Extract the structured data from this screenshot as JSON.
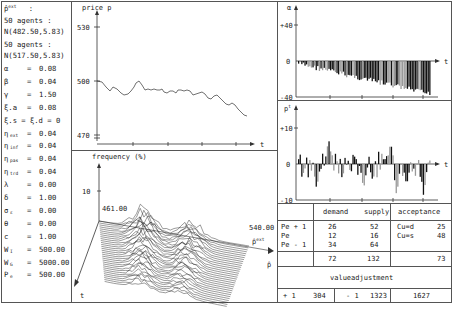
{
  "parameters": {
    "header_symbol": "p̂",
    "header_sup": "ext",
    "header_colon": ":",
    "group1": {
      "label": "50  agents  :",
      "dist": "N(482.50,5.83)"
    },
    "group2": {
      "label": "50  agents  :",
      "dist": "N(517.50,5.83)"
    },
    "rows": [
      {
        "sym": "α",
        "sub": "",
        "eq": "=",
        "val": "0.08"
      },
      {
        "sym": "β",
        "sub": "",
        "eq": "=",
        "val": "0.04"
      },
      {
        "sym": "γ",
        "sub": "",
        "eq": "=",
        "val": "1.50"
      },
      {
        "sym": "ξ.a",
        "sub": "",
        "eq": "=",
        "val": "0.08"
      },
      {
        "sym": "ξ.s = ξ.d = 0",
        "sub": "",
        "eq": "",
        "val": ""
      },
      {
        "sym": "η",
        "sub": "ext",
        "eq": "=",
        "val": "0.04"
      },
      {
        "sym": "η",
        "sub": "inf",
        "eq": "=",
        "val": "0.04"
      },
      {
        "sym": "η",
        "sub": "pas",
        "eq": "=",
        "val": "0.04"
      },
      {
        "sym": "η",
        "sub": "trd",
        "eq": "=",
        "val": "0.04"
      },
      {
        "sym": "λ",
        "sub": "",
        "eq": "=",
        "val": "0.00"
      },
      {
        "sym": "δ",
        "sub": "",
        "eq": "=",
        "val": "1.00"
      },
      {
        "sym": "σ",
        "sub": "ε",
        "eq": "=",
        "val": "0.00"
      },
      {
        "sym": "θ",
        "sub": "",
        "eq": "=",
        "val": "0.00"
      },
      {
        "sym": "c",
        "sub": "",
        "eq": "=",
        "val": "1.00"
      },
      {
        "sym": "W",
        "sub": "I",
        "eq": "=",
        "val": "500.00"
      },
      {
        "sym": "W",
        "sub": "G",
        "eq": "=",
        "val": "5000.00"
      },
      {
        "sym": "P",
        "sub": "e",
        "eq": "=",
        "val": "500.00"
      }
    ]
  },
  "price_plot": {
    "ylabel": "price p",
    "xlabel": "t",
    "ticks": [
      "530",
      "500",
      "470"
    ]
  },
  "freq_plot": {
    "zlabel": "frequency (%)",
    "ztick": "10",
    "left_value": "461.00",
    "right_value": "540.00",
    "axis_pext": "p̂",
    "axis_pext_sup": "ext",
    "axis_p": "p̂",
    "axis_t": "t"
  },
  "alpha_plot": {
    "ylabel": "α",
    "xlabel": "t",
    "ticks": [
      "+40",
      "0",
      "-40"
    ]
  },
  "pt_plot": {
    "ylabel": "p",
    "ylabel_sup": "t",
    "xlabel": "t",
    "ticks": [
      "+10",
      "0",
      "-10"
    ]
  },
  "table": {
    "headers": [
      "",
      "demand",
      "supply",
      "acceptance"
    ],
    "rows": [
      {
        "label": "Pe + 1",
        "demand": "26",
        "supply": "52",
        "acc_label": "Cu=d",
        "acc_val": "25"
      },
      {
        "label": "Pe",
        "demand": "12",
        "supply": "16",
        "acc_label": "Cu=s",
        "acc_val": "48"
      },
      {
        "label": "Pe - 1",
        "demand": "34",
        "supply": "64",
        "acc_label": "",
        "acc_val": ""
      }
    ],
    "totals": {
      "demand": "72",
      "supply": "132",
      "acceptance": "73"
    },
    "value_title": "valueadjustment",
    "value_row": {
      "plus_label": "+ 1",
      "plus_val": "304",
      "minus_label": "- 1",
      "minus_val": "1323",
      "total": "1627"
    }
  },
  "chart_data": [
    {
      "type": "line",
      "title": "",
      "xlabel": "t",
      "ylabel": "price p",
      "yticks": [
        470,
        500,
        530
      ],
      "ylim": [
        470,
        530
      ],
      "x": [
        0,
        1,
        2,
        3,
        4,
        5,
        6,
        7,
        8,
        9,
        10,
        11,
        12,
        13,
        14,
        15,
        16,
        17,
        18,
        19,
        20
      ],
      "values": [
        500,
        499,
        496,
        497,
        494,
        495,
        500,
        496,
        496,
        495,
        494,
        494,
        492,
        493,
        491,
        488,
        490,
        486,
        485,
        482,
        479
      ]
    },
    {
      "type": "bar",
      "title": "",
      "xlabel": "t",
      "ylabel": "α",
      "yticks": [
        -40,
        0,
        40
      ],
      "ylim": [
        -40,
        40
      ],
      "description": "negative bars growing from ~-2 to ~-38 over time"
    },
    {
      "type": "bar",
      "title": "",
      "xlabel": "t",
      "ylabel": "p^t",
      "yticks": [
        -10,
        0,
        10
      ],
      "ylim": [
        -10,
        10
      ],
      "description": "oscillating bars between ~-9 and ~+7"
    }
  ]
}
